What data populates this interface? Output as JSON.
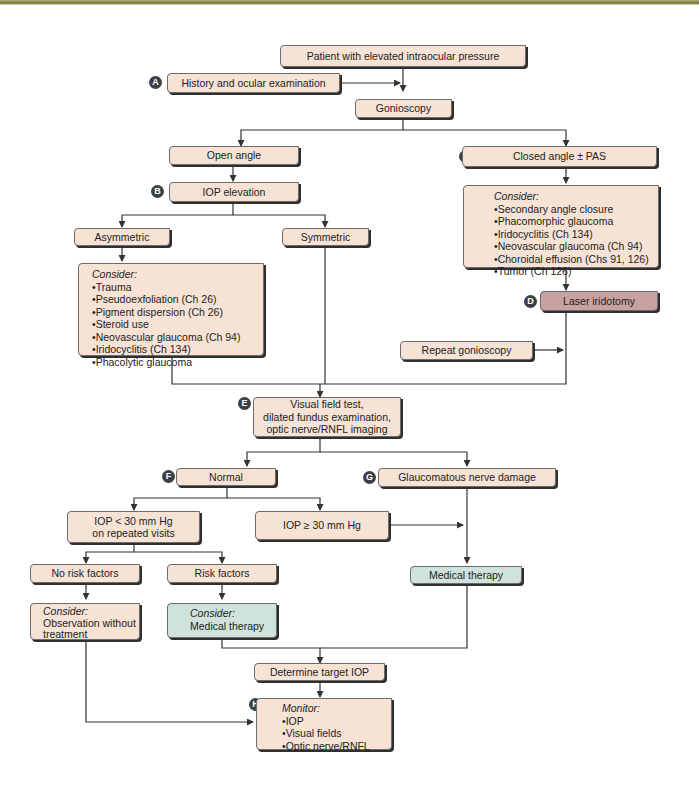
{
  "title": "Patient with elevated intraocular pressure",
  "colors": {
    "box_fill": "#f6e3d6",
    "therapy_fill": "#cfe3dc",
    "laser_fill": "#c9a1a1",
    "badge_fill": "#3a3f48",
    "line": "#333333"
  },
  "badges": {
    "a": "A",
    "b": "B",
    "c": "C",
    "d": "D",
    "e": "E",
    "f": "F",
    "g": "G",
    "h": "H"
  },
  "nodes": {
    "start": "Patient with elevated intraocular pressure",
    "history": "History and ocular examination",
    "gonioscopy": "Gonioscopy",
    "open_angle": "Open angle",
    "closed_angle": "Closed angle ± PAS",
    "iop_elevation": "IOP elevation",
    "asymmetric": "Asymmetric",
    "symmetric": "Symmetric",
    "asym_consider": {
      "heading": "Consider:",
      "items": [
        "Trauma",
        "Pseudoexfoliation (Ch 26)",
        "Pigment dispersion (Ch 26)",
        "Steroid use",
        "Neovascular glaucoma (Ch 94)",
        "Iridocyclitis (Ch 134)",
        "Phacolytic glaucoma"
      ]
    },
    "closed_consider": {
      "heading": "Consider:",
      "items": [
        "Secondary angle closure",
        "Phacomorphic glaucoma",
        "Iridocyclitis (Ch 134)",
        "Neovascular glaucoma (Ch 94)",
        "Choroidal effusion (Chs 91, 126)",
        "Tumor (Ch 126)"
      ]
    },
    "laser": "Laser iridotomy",
    "repeat_gonio": "Repeat gonioscopy",
    "visual_field": [
      "Visual field test,",
      "dilated fundus examination,",
      "optic nerve/RNFL imaging"
    ],
    "normal": "Normal",
    "glaucomatous": "Glaucomatous nerve damage",
    "iop_lt30": [
      "IOP < 30 mm Hg",
      "on repeated visits"
    ],
    "iop_ge30": "IOP ≥ 30 mm Hg",
    "medical_therapy": "Medical therapy",
    "no_risk": "No risk factors",
    "risk": "Risk factors",
    "observe": {
      "heading": "Consider:",
      "lines": [
        "Observation without",
        "treatment"
      ]
    },
    "risk_consider": {
      "heading": "Consider:",
      "lines": [
        "Medical therapy"
      ]
    },
    "target_iop": "Determine target IOP",
    "monitor": {
      "heading": "Monitor:",
      "items": [
        "IOP",
        "Visual fields",
        "Optic nerve/RNFL"
      ]
    }
  }
}
